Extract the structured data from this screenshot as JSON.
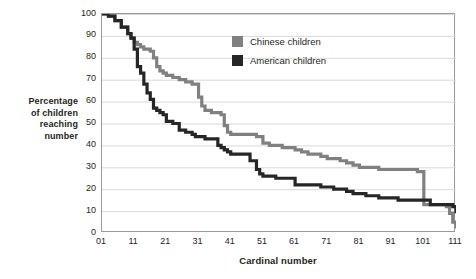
{
  "chart_data": {
    "type": "line",
    "title": "",
    "subtitle": "",
    "xlabel": "Cardinal number",
    "ylabel": "Percentage of children reaching number",
    "ylabel_lines": [
      "Percentage",
      "of children",
      "reaching",
      "number"
    ],
    "xlim": [
      1,
      111
    ],
    "ylim": [
      0,
      100
    ],
    "grid": "horizontal",
    "legend_position": "top-right-inside",
    "xticks": [
      "01",
      "11",
      "21",
      "31",
      "41",
      "51",
      "61",
      "71",
      "81",
      "91",
      "101",
      "111"
    ],
    "xtick_values": [
      1,
      11,
      21,
      31,
      41,
      51,
      61,
      71,
      81,
      91,
      101,
      111
    ],
    "yticks": [
      "0",
      "10",
      "20",
      "30",
      "40",
      "50",
      "60",
      "70",
      "80",
      "90",
      "100"
    ],
    "ytick_values": [
      0,
      10,
      20,
      30,
      40,
      50,
      60,
      70,
      80,
      90,
      100
    ],
    "colors": {
      "chinese": "#808080",
      "american": "#262626",
      "grid": "#d9d9d9",
      "frame": "#9a9a9a",
      "background": "#ffffff",
      "text": "#231f20"
    },
    "series": [
      {
        "name": "Chinese children",
        "color": "#808080",
        "x": [
          1,
          3,
          5,
          7,
          9,
          10,
          11,
          12,
          13,
          14,
          15,
          16,
          17,
          18,
          19,
          20,
          21,
          23,
          25,
          27,
          29,
          30,
          31,
          32,
          33,
          35,
          37,
          38,
          39,
          40,
          41,
          43,
          45,
          47,
          49,
          50,
          51,
          53,
          55,
          57,
          59,
          61,
          63,
          65,
          67,
          69,
          70,
          71,
          73,
          75,
          77,
          79,
          80,
          81,
          83,
          85,
          87,
          89,
          91,
          93,
          95,
          97,
          99,
          100,
          101,
          103,
          105,
          107,
          108,
          109,
          110,
          111
        ],
        "y": [
          100,
          99,
          97,
          94,
          91,
          89,
          87,
          86,
          85,
          84,
          84,
          83,
          80,
          76,
          74,
          73,
          72,
          71,
          70,
          69,
          68,
          68,
          62,
          58,
          56,
          55,
          55,
          54,
          49,
          46,
          45,
          45,
          45,
          45,
          44,
          44,
          41,
          40,
          40,
          39,
          39,
          38,
          37,
          36,
          36,
          35,
          35,
          34,
          34,
          33,
          32,
          31,
          31,
          30,
          30,
          30,
          29,
          29,
          29,
          29,
          29,
          29,
          28,
          28,
          13,
          13,
          13,
          13,
          12,
          9,
          5,
          2
        ]
      },
      {
        "name": "American children",
        "color": "#262626",
        "x": [
          1,
          3,
          5,
          7,
          9,
          10,
          11,
          12,
          13,
          14,
          15,
          16,
          17,
          18,
          19,
          20,
          21,
          23,
          25,
          27,
          29,
          30,
          31,
          32,
          33,
          35,
          36,
          37,
          38,
          39,
          40,
          41,
          43,
          45,
          47,
          49,
          50,
          51,
          53,
          55,
          57,
          59,
          61,
          63,
          65,
          67,
          69,
          70,
          71,
          73,
          75,
          77,
          79,
          81,
          83,
          85,
          87,
          89,
          91,
          93,
          95,
          97,
          99,
          101,
          103,
          105,
          107,
          108,
          109,
          110,
          111
        ],
        "y": [
          100,
          99,
          97,
          94,
          91,
          89,
          84,
          76,
          73,
          68,
          64,
          61,
          57,
          56,
          55,
          54,
          51,
          50,
          47,
          46,
          45,
          44,
          44,
          44,
          43,
          43,
          43,
          40,
          39,
          38,
          37,
          36,
          36,
          36,
          33,
          29,
          27,
          26,
          26,
          25,
          25,
          25,
          22,
          22,
          22,
          22,
          21,
          21,
          21,
          20,
          20,
          19,
          18,
          18,
          17,
          17,
          16,
          16,
          16,
          15,
          15,
          15,
          15,
          15,
          13,
          13,
          13,
          13,
          13,
          12,
          9
        ]
      }
    ]
  },
  "legend": {
    "items": [
      {
        "label": "Chinese children",
        "color": "#808080"
      },
      {
        "label": "American children",
        "color": "#262626"
      }
    ]
  },
  "axes": {
    "x_title": "Cardinal number",
    "y_title_lines": [
      "Percentage",
      "of children",
      "reaching",
      "number"
    ]
  }
}
